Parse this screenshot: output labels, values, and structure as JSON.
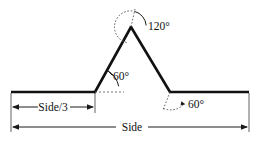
{
  "figure": {
    "background_color": "#ffffff",
    "stroke_color": "#111111",
    "thin_stroke_color": "#3a3a3a"
  },
  "angles": {
    "apex": {
      "value": "120°",
      "name": "apex-angle",
      "arc_style": "dotted"
    },
    "left_base": {
      "value": "60°",
      "name": "left-base-angle",
      "arc_style": "solid"
    },
    "right_base": {
      "value": "60°",
      "name": "right-base-angle",
      "arc_style": "dotted"
    }
  },
  "dimensions": {
    "partial": {
      "label": "Side/3",
      "name": "side-over-three-dimension"
    },
    "full": {
      "label": "Side",
      "name": "side-dimension"
    }
  },
  "geometry": {
    "left_end_x": 11,
    "right_end_x": 249,
    "baseline_y": 92,
    "left_base_x": 95,
    "right_base_x": 170,
    "apex_x": 131,
    "apex_y": 27
  }
}
